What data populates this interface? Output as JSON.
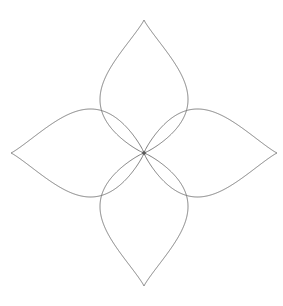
{
  "figure": {
    "type": "polar-rose",
    "background_color": "#ffffff",
    "stroke_color": "#6e6e6e",
    "stroke_width": 0.9,
    "canvas": {
      "width": 283,
      "height": 306
    },
    "center": {
      "x": 144,
      "y": 153
    },
    "petal_count": 4,
    "petal_length": 133,
    "petal_max_width": 88,
    "petal_shape": "teardrop",
    "petal_tip_angles_deg": [
      270,
      0,
      90,
      180
    ],
    "bounds": {
      "top": 20,
      "bottom": 286,
      "left": 16,
      "right": 275
    },
    "center_dot_radius": 1.8,
    "caption": ""
  },
  "chart_data": {
    "type": "line",
    "xlabel": "",
    "ylabel": "",
    "coordinate_system": "polar",
    "equation": "r = a * cos(2*theta)",
    "parameters": {
      "a": 133,
      "k": 2
    },
    "grid": false,
    "legend": null,
    "xlim": [
      16,
      275
    ],
    "ylim": [
      20,
      286
    ],
    "series": [
      {
        "name": "petal-up",
        "tip_angle_deg": 270,
        "tip_point": {
          "x": 144,
          "y": 20
        },
        "max_width": 88
      },
      {
        "name": "petal-right",
        "tip_angle_deg": 0,
        "tip_point": {
          "x": 275,
          "y": 152
        },
        "max_width": 88
      },
      {
        "name": "petal-down",
        "tip_angle_deg": 90,
        "tip_point": {
          "x": 144,
          "y": 286
        },
        "max_width": 88
      },
      {
        "name": "petal-left",
        "tip_angle_deg": 180,
        "tip_point": {
          "x": 16,
          "y": 152
        },
        "max_width": 88
      }
    ]
  }
}
